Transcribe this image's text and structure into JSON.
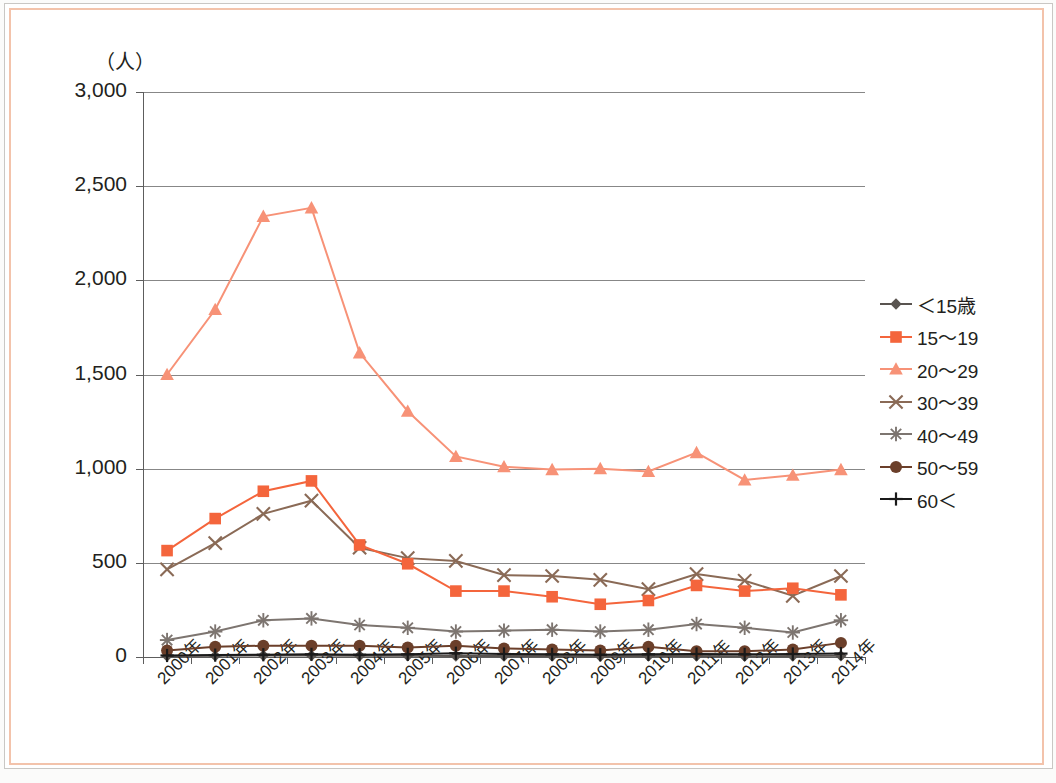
{
  "chart_data": {
    "type": "line",
    "title": "",
    "xlabel": "",
    "ylabel": "（人）",
    "y_unit_label": "（人）",
    "ylim": [
      0,
      3000
    ],
    "y_ticks": [
      0,
      500,
      1000,
      1500,
      2000,
      2500,
      3000
    ],
    "y_tick_labels": [
      "0",
      "500",
      "1,000",
      "1,500",
      "2,000",
      "2,500",
      "3,000"
    ],
    "grid": true,
    "grid_axis": "y",
    "legend_position": "right",
    "categories": [
      "2000年",
      "2001年",
      "2002年",
      "2003年",
      "2004年",
      "2005年",
      "2006年",
      "2007年",
      "2008年",
      "2009年",
      "2010年",
      "2011年",
      "2012年",
      "2013年",
      "2014年"
    ],
    "series": [
      {
        "name": "＜15歳",
        "color": "#595450",
        "marker": "diamond",
        "values": [
          5,
          6,
          8,
          8,
          7,
          6,
          5,
          5,
          5,
          4,
          5,
          5,
          4,
          5,
          6
        ]
      },
      {
        "name": "15〜19",
        "color": "#f4653c",
        "marker": "square",
        "values": [
          565,
          735,
          880,
          935,
          595,
          495,
          350,
          350,
          320,
          280,
          300,
          380,
          350,
          365,
          330
        ]
      },
      {
        "name": "20〜29",
        "color": "#f79277",
        "marker": "triangle",
        "values": [
          1500,
          1845,
          2340,
          2385,
          1615,
          1305,
          1065,
          1010,
          995,
          1000,
          985,
          1085,
          940,
          965,
          995
        ]
      },
      {
        "name": "30〜39",
        "color": "#8a6a56",
        "marker": "x",
        "values": [
          465,
          605,
          760,
          830,
          580,
          525,
          510,
          435,
          430,
          410,
          360,
          440,
          405,
          325,
          430
        ]
      },
      {
        "name": "40〜49",
        "color": "#7d7570",
        "marker": "asterisk",
        "values": [
          90,
          135,
          195,
          205,
          170,
          155,
          135,
          140,
          145,
          135,
          145,
          175,
          155,
          130,
          195
        ]
      },
      {
        "name": "50〜59",
        "color": "#6b3f2a",
        "marker": "circle",
        "values": [
          35,
          55,
          60,
          60,
          60,
          50,
          60,
          45,
          40,
          35,
          55,
          30,
          30,
          40,
          75
        ]
      },
      {
        "name": "60＜",
        "color": "#1a1a1a",
        "marker": "plus",
        "values": [
          8,
          10,
          12,
          14,
          12,
          14,
          20,
          16,
          14,
          12,
          14,
          16,
          14,
          16,
          18
        ]
      }
    ],
    "legend": [
      {
        "label": "＜15歳",
        "color": "#595450",
        "marker": "diamond"
      },
      {
        "label": "15〜19",
        "color": "#f4653c",
        "marker": "square"
      },
      {
        "label": "20〜29",
        "color": "#f79277",
        "marker": "triangle"
      },
      {
        "label": "30〜39",
        "color": "#8a6a56",
        "marker": "x"
      },
      {
        "label": "40〜49",
        "color": "#7d7570",
        "marker": "asterisk"
      },
      {
        "label": "50〜59",
        "color": "#6b3f2a",
        "marker": "circle"
      },
      {
        "label": "60＜",
        "color": "#1a1a1a",
        "marker": "plus"
      }
    ]
  },
  "frame": {
    "border_color": "#f3c3ab",
    "outer_edge_color": "#c9c7c4"
  },
  "caption": {
    "text": ""
  }
}
